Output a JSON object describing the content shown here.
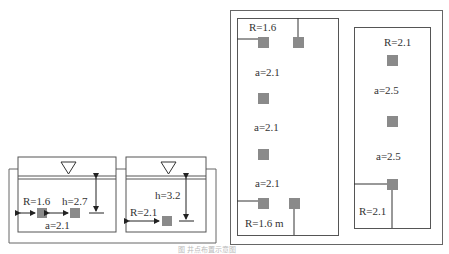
{
  "figure": {
    "caption": "图 井点布置示意图",
    "colors": {
      "line": "#555555",
      "well": "#8a8a8a",
      "text": "#333333"
    }
  },
  "section_view": {
    "tank_left": {
      "labels": {
        "R": "R=1.6",
        "h": "h=2.7",
        "a": "a=2.1"
      }
    },
    "tank_right": {
      "labels": {
        "h": "h=3.2",
        "R": "R=2.1"
      }
    }
  },
  "plan_view": {
    "left_zone": {
      "labels": {
        "R_top": "R=1.6",
        "a1": "a=2.1",
        "a2": "a=2.1",
        "a3": "a=2.1",
        "R_bottom": "R=1.6 m"
      }
    },
    "right_zone": {
      "labels": {
        "R_top": "R=2.1",
        "a1": "a=2.5",
        "a2": "a=2.5",
        "R_bottom": "R=2.1"
      }
    }
  }
}
